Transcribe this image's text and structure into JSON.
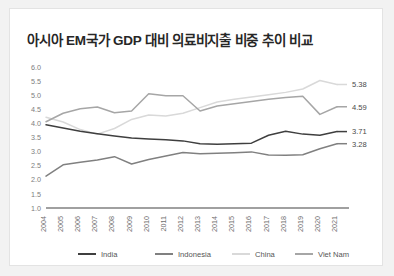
{
  "card": {
    "background": "#ffffff",
    "border_color": "#e3e3e3"
  },
  "header": {
    "title": "아시아 EM국가 GDP 대비 의료비지출 비중 추이 비교"
  },
  "legend": {
    "position": "bottom",
    "items": [
      {
        "label": "India",
        "color": "#3f3f3f"
      },
      {
        "label": "Indonesia",
        "color": "#808080"
      },
      {
        "label": "China",
        "color": "#d9d9d9"
      },
      {
        "label": "Viet Nam",
        "color": "#a6a6a6"
      }
    ]
  },
  "axis": {
    "y_ticks": [
      "6.0",
      "5.5",
      "5.0",
      "4.5",
      "4.0",
      "3.5",
      "3.0",
      "2.5",
      "2.0",
      "1.5",
      "1.0"
    ],
    "x_ticks": [
      "2004",
      "2005",
      "2006",
      "2007",
      "2008",
      "2009",
      "2010",
      "2011",
      "2012",
      "2013",
      "2014",
      "2015",
      "2016",
      "2017",
      "2018",
      "2019",
      "2020",
      "2021"
    ]
  },
  "end_labels": [
    {
      "text": "5.38",
      "series": "China"
    },
    {
      "text": "4.59",
      "series": "Viet Nam"
    },
    {
      "text": "3.71",
      "series": "India"
    },
    {
      "text": "3.28",
      "series": "Indonesia"
    }
  ],
  "chart_data": {
    "type": "line",
    "title": "아시아 EM국가 GDP 대비 의료비지출 비중 추이 비교",
    "xlabel": "",
    "ylabel": "",
    "ylim": [
      1.0,
      6.0
    ],
    "ytick_step": 0.5,
    "grid": false,
    "legend_position": "bottom",
    "categories": [
      "2004",
      "2005",
      "2006",
      "2007",
      "2008",
      "2009",
      "2010",
      "2011",
      "2012",
      "2013",
      "2014",
      "2015",
      "2016",
      "2017",
      "2018",
      "2019",
      "2020",
      "2021"
    ],
    "series": [
      {
        "name": "India",
        "color": "#3f3f3f",
        "values": [
          3.95,
          3.84,
          3.72,
          3.63,
          3.55,
          3.48,
          3.45,
          3.42,
          3.38,
          3.28,
          3.26,
          3.28,
          3.3,
          3.58,
          3.72,
          3.62,
          3.58,
          3.71
        ]
      },
      {
        "name": "Indonesia",
        "color": "#808080",
        "values": [
          2.13,
          2.53,
          2.62,
          2.7,
          2.82,
          2.56,
          2.72,
          2.84,
          2.97,
          2.92,
          2.94,
          2.96,
          2.99,
          2.88,
          2.87,
          2.89,
          3.1,
          3.28
        ]
      },
      {
        "name": "China",
        "color": "#d9d9d9",
        "values": [
          4.22,
          4.05,
          3.78,
          3.62,
          3.82,
          4.14,
          4.3,
          4.26,
          4.36,
          4.56,
          4.76,
          4.86,
          4.94,
          5.02,
          5.1,
          5.22,
          5.52,
          5.38
        ]
      },
      {
        "name": "Viet Nam",
        "color": "#a6a6a6",
        "values": [
          4.06,
          4.36,
          4.52,
          4.58,
          4.38,
          4.44,
          5.05,
          4.98,
          4.98,
          4.44,
          4.62,
          4.7,
          4.78,
          4.86,
          4.92,
          4.96,
          4.32,
          4.59
        ]
      }
    ]
  }
}
